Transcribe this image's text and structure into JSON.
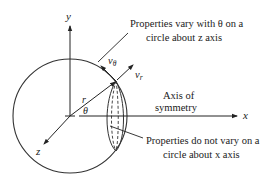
{
  "diagram": {
    "colors": {
      "stroke": "#333333",
      "text": "#1a1a1a",
      "background": "#ffffff"
    },
    "axes": {
      "y": "y",
      "z": "z",
      "x": "x"
    },
    "symbols": {
      "radius": "r",
      "angle": "θ",
      "v_theta": "vθ",
      "v_theta_base": "v",
      "v_theta_sub": "θ",
      "v_r_base": "v",
      "v_r_sub": "r"
    },
    "annotations": {
      "top_line1": "Properties vary with θ on a",
      "top_line2": "circle about z axis",
      "axis_line1": "Axis of",
      "axis_line2": "symmetry",
      "bottom_line1": "Properties do not vary on a",
      "bottom_line2": "circle about x axis"
    }
  }
}
